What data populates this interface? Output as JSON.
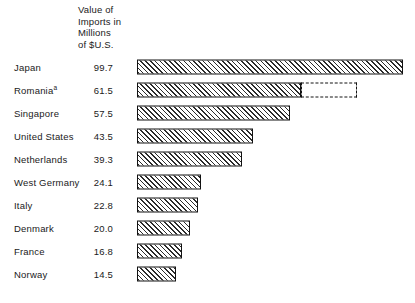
{
  "chart_data": {
    "type": "bar",
    "orientation": "horizontal",
    "title": "",
    "xlabel": "",
    "ylabel": "",
    "value_column_header": [
      "Value of",
      "Imports in",
      "Millions",
      "of $U.S."
    ],
    "value_unit": "Millions of $U.S.",
    "grid": false,
    "legend": false,
    "xlim": [
      0,
      100
    ],
    "categories": [
      "Japan",
      "Romania",
      "Singapore",
      "United States",
      "Netherlands",
      "West Germany",
      "Italy",
      "Denmark",
      "France",
      "Norway"
    ],
    "values": [
      99.7,
      61.5,
      57.5,
      43.5,
      39.3,
      24.1,
      22.8,
      20.0,
      16.8,
      14.5
    ],
    "value_labels": [
      "99.7",
      "61.5",
      "57.5",
      "43.5",
      "39.3",
      "24.1",
      "22.8",
      "20.0",
      "16.8",
      "14.5"
    ],
    "annotations": [
      {
        "category": "Romania",
        "footnote_marker": "a",
        "projected_extension_to": 82.5,
        "style": "dashed-outline"
      }
    ],
    "rows": [
      {
        "label": "Japan",
        "marker": "",
        "value_label": "99.7",
        "value": 99.7,
        "projected_to": null
      },
      {
        "label": "Romania",
        "marker": "a",
        "value_label": "61.5",
        "value": 61.5,
        "projected_to": 82.5
      },
      {
        "label": "Singapore",
        "marker": "",
        "value_label": "57.5",
        "value": 57.5,
        "projected_to": null
      },
      {
        "label": "United States",
        "marker": "",
        "value_label": "43.5",
        "value": 43.5,
        "projected_to": null
      },
      {
        "label": "Netherlands",
        "marker": "",
        "value_label": "39.3",
        "value": 39.3,
        "projected_to": null
      },
      {
        "label": "West Germany",
        "marker": "",
        "value_label": "24.1",
        "value": 24.1,
        "projected_to": null
      },
      {
        "label": "Italy",
        "marker": "",
        "value_label": "22.8",
        "value": 22.8,
        "projected_to": null
      },
      {
        "label": "Denmark",
        "marker": "",
        "value_label": "20.0",
        "value": 20.0,
        "projected_to": null
      },
      {
        "label": "France",
        "marker": "",
        "value_label": "16.8",
        "value": 16.8,
        "projected_to": null
      },
      {
        "label": "Norway",
        "marker": "",
        "value_label": "14.5",
        "value": 14.5,
        "projected_to": null
      }
    ],
    "colors": {
      "bar_outline": "#121212",
      "bar_hatch": "#2b2b2b",
      "bar_fill": "#ffffff",
      "background": "#ffffff",
      "text": "#1a1a1a"
    }
  }
}
